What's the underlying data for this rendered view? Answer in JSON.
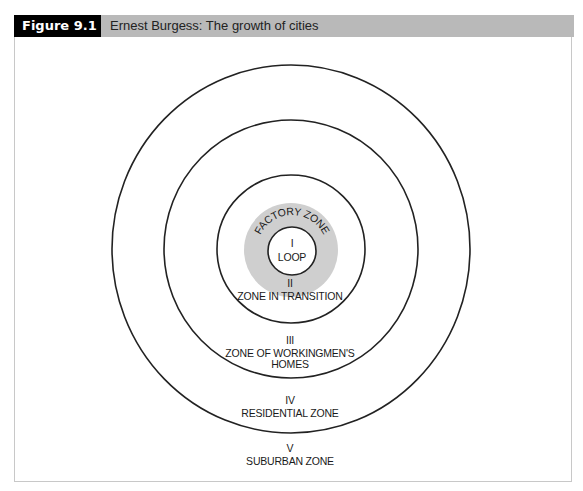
{
  "figure": {
    "label": "Figure 9.1",
    "title": "Ernest Burgess: The growth of cities"
  },
  "colors": {
    "header_bg": "#b9b9b9",
    "label_bg": "#000000",
    "factory_zone_fill": "#cfcfcf",
    "ring_stroke": "#222222"
  },
  "zones": [
    {
      "numeral": "I",
      "name": "LOOP"
    },
    {
      "numeral": "",
      "name": "FACTORY ZONE"
    },
    {
      "numeral": "II",
      "name": "ZONE IN TRANSITION"
    },
    {
      "numeral": "III",
      "name": "ZONE OF WORKINGMEN'S",
      "name2": "HOMES"
    },
    {
      "numeral": "IV",
      "name": "RESIDENTIAL ZONE"
    },
    {
      "numeral": "V",
      "name": "SUBURBAN ZONE"
    }
  ]
}
